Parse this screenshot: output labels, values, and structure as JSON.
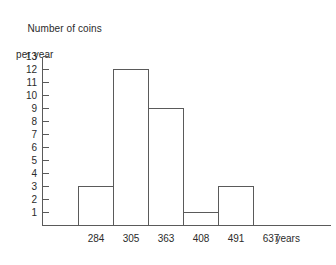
{
  "chart_data": {
    "type": "bar",
    "title": "Number of coins per year",
    "title_lines": [
      "Number of coins",
      "per year"
    ],
    "xlabel": "years",
    "ylabel": "Number of coins per year",
    "categories": [
      "284",
      "305",
      "363",
      "408",
      "491",
      "637"
    ],
    "values": [
      3,
      12,
      9,
      1,
      3,
      0
    ],
    "bars": [
      {
        "label": "284",
        "value": 3
      },
      {
        "label": "305",
        "value": 12
      },
      {
        "label": "363",
        "value": 9
      },
      {
        "label": "408",
        "value": 1
      },
      {
        "label": "491",
        "value": 3
      }
    ],
    "ylim": [
      0,
      13
    ],
    "xlim_labels": [
      "284",
      "637"
    ],
    "ytick_labels": [
      "13",
      "12",
      "11",
      "10",
      "9",
      "8",
      "7",
      "6",
      "5",
      "4",
      "3",
      "2",
      "1"
    ],
    "yticks": [
      13,
      12,
      11,
      10,
      9,
      8,
      7,
      6,
      5,
      4,
      3,
      2,
      1
    ],
    "grid": false,
    "legend": null,
    "colors": {
      "bar_fill": "#ffffff",
      "bar_stroke": "#5a5a5a",
      "axis": "#5a5a5a",
      "text": "#2b2b2b",
      "background": "#ffffff"
    }
  },
  "axis": {
    "y_title_line1": "Number of coins",
    "y_title_line2": "per year",
    "x_unit": "years"
  }
}
